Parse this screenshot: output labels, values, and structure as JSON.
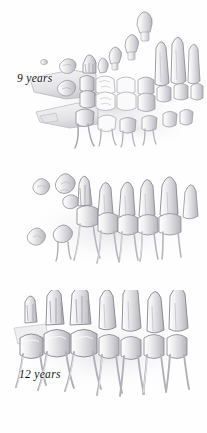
{
  "figure": {
    "medium": "grayscale pencil / airbrush anatomical illustration",
    "view": "lateral view of mandible and maxillary teeth",
    "background_color": "#fefefe",
    "width_px": 207,
    "height_px": 433
  },
  "palette": {
    "enamel_light": "#f4f4f5",
    "enamel_mid": "#dcdcdf",
    "enamel_shadow": "#b9b9be",
    "outline": "#8d8d93",
    "outline_dark": "#6e6e75",
    "root_light": "#ececed",
    "root_shadow": "#c6c6ca",
    "bone_tint": "#e8e8ea",
    "cast_shadow": "#d2d2d6",
    "label_text": "#16161a",
    "background": "#fefefe"
  },
  "panels": [
    {
      "id": "stage-9",
      "label": "9 years",
      "description": "Mixed dentition. Erupted deciduous molars and permanent first molar in the arch, with unerupted permanent tooth crowns and buds suspended above and below the jaw line.",
      "erupted_count": 8,
      "developing_buds_upper": 6,
      "developing_buds_lower": 4,
      "roots_visible": "partial, incomplete apices"
    },
    {
      "id": "stage-12",
      "label": "12 years",
      "description": "Early permanent dentition. Full arch of permanent teeth with lengthening roots; unerupted third molar crowns visible at the posterior left.",
      "erupted_count": 7,
      "developing_buds_upper": 3,
      "developing_buds_lower": 2,
      "roots_visible": "long, nearly complete"
    },
    {
      "id": "stage-21",
      "label": "21 years",
      "description": "Complete adult dentition. All permanent teeth erupted and in occlusion with fully formed, closed-apex roots, including molars with multiple divergent roots.",
      "erupted_count": 8,
      "developing_buds_upper": 0,
      "developing_buds_lower": 0,
      "roots_visible": "complete, closed apices"
    }
  ]
}
